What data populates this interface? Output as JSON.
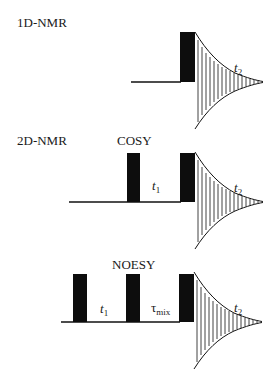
{
  "diagram": {
    "type": "NMR pulse sequences",
    "colors": {
      "ink": "#111111",
      "background": "#ffffff"
    },
    "sections": [
      {
        "id": "1d",
        "label": "1D-NMR",
        "title": "",
        "pulses": 1,
        "delays": [],
        "acquisition": {
          "symbol": "t",
          "subscript": "2"
        }
      },
      {
        "id": "cosy",
        "label": "2D-NMR",
        "title": "COSY",
        "pulses": 2,
        "delays": [
          {
            "symbol": "t",
            "subscript": "1"
          }
        ],
        "acquisition": {
          "symbol": "t",
          "subscript": "2"
        }
      },
      {
        "id": "noesy",
        "label": "",
        "title": "NOESY",
        "pulses": 3,
        "delays": [
          {
            "symbol": "t",
            "subscript": "1"
          },
          {
            "symbol": "τ",
            "subscript": "mix"
          }
        ],
        "acquisition": {
          "symbol": "t",
          "subscript": "2"
        }
      }
    ]
  }
}
